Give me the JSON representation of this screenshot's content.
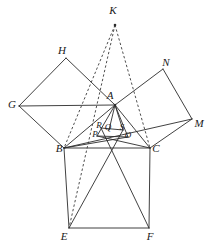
{
  "figure": {
    "background_color": "#ffffff",
    "stroke_color": "#2b2b2b",
    "dash_color": "#3a3a3a",
    "width": 220,
    "height": 250
  },
  "points": {
    "K": {
      "label": "K",
      "x": 115,
      "y": 25,
      "label_x": 113,
      "label_y": 10,
      "size": "normal"
    },
    "H": {
      "label": "H",
      "x": 66,
      "y": 58,
      "label_x": 62,
      "label_y": 50,
      "size": "normal"
    },
    "N": {
      "label": "N",
      "x": 163,
      "y": 69,
      "label_x": 166,
      "label_y": 62,
      "size": "normal"
    },
    "G": {
      "label": "G",
      "x": 19,
      "y": 106,
      "label_x": 12,
      "label_y": 104,
      "size": "normal"
    },
    "A": {
      "label": "A",
      "x": 115,
      "y": 105,
      "label_x": 110,
      "label_y": 95,
      "size": "normal"
    },
    "M": {
      "label": "M",
      "x": 192,
      "y": 119,
      "label_x": 199,
      "label_y": 123,
      "size": "normal"
    },
    "R": {
      "label": "R",
      "x": 101,
      "y": 128,
      "label_x": 99,
      "label_y": 125,
      "size": "small"
    },
    "Q": {
      "label": "Q",
      "x": 109,
      "y": 130,
      "label_x": 108,
      "label_y": 127,
      "size": "small"
    },
    "S": {
      "label": "S",
      "x": 123,
      "y": 130,
      "label_x": 122,
      "label_y": 127,
      "size": "small"
    },
    "P": {
      "label": "P",
      "x": 97,
      "y": 136,
      "label_x": 95,
      "label_y": 134,
      "size": "small"
    },
    "O": {
      "label": "O",
      "x": 128,
      "y": 137,
      "label_x": 128,
      "label_y": 135,
      "size": "small"
    },
    "B": {
      "label": "B",
      "x": 64,
      "y": 148,
      "label_x": 59,
      "label_y": 148,
      "size": "normal"
    },
    "C": {
      "label": "C",
      "x": 150,
      "y": 148,
      "label_x": 156,
      "label_y": 148,
      "size": "normal"
    },
    "E": {
      "label": "E",
      "x": 69,
      "y": 228,
      "label_x": 64,
      "label_y": 236,
      "size": "normal"
    },
    "F": {
      "label": "F",
      "x": 149,
      "y": 228,
      "label_x": 150,
      "label_y": 236,
      "size": "normal"
    }
  },
  "solid_segments": [
    [
      "G",
      "H"
    ],
    [
      "H",
      "A"
    ],
    [
      "A",
      "G"
    ],
    [
      "G",
      "B"
    ],
    [
      "B",
      "A"
    ],
    [
      "A",
      "N"
    ],
    [
      "N",
      "M"
    ],
    [
      "M",
      "C"
    ],
    [
      "C",
      "A"
    ],
    [
      "M",
      "B"
    ],
    [
      "B",
      "C"
    ],
    [
      "B",
      "E"
    ],
    [
      "E",
      "F"
    ],
    [
      "F",
      "C"
    ],
    [
      "A",
      "P"
    ],
    [
      "A",
      "Q"
    ],
    [
      "A",
      "S"
    ],
    [
      "A",
      "O"
    ],
    [
      "B",
      "O"
    ],
    [
      "C",
      "P"
    ],
    [
      "E",
      "S"
    ],
    [
      "F",
      "R"
    ],
    [
      "P",
      "O"
    ],
    [
      "R",
      "S"
    ]
  ],
  "dashed_segments": [
    [
      "K",
      "B"
    ],
    [
      "K",
      "C"
    ],
    [
      "K",
      "E"
    ]
  ],
  "labels_order": [
    "K",
    "H",
    "N",
    "G",
    "A",
    "M",
    "R",
    "Q",
    "S",
    "P",
    "O",
    "B",
    "C",
    "E",
    "F"
  ]
}
